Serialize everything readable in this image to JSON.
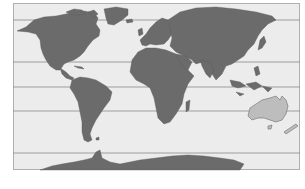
{
  "map": {
    "type": "world-map",
    "projection": "equirectangular",
    "highlighted_region": "Australia",
    "colors": {
      "ocean": "#ececec",
      "land": "#6b6b6b",
      "highlight": "#bdbdbd",
      "latitude_lines": "#8a8a8a",
      "frame": "#b0b0b0"
    },
    "latitude_lines_y": [
      20,
      62,
      87,
      111,
      153
    ]
  }
}
